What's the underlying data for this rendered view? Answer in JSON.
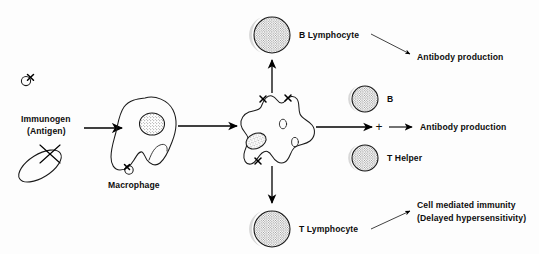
{
  "diagram": {
    "background_color": "#fdfdfd",
    "ink_color": "#1a1a1a",
    "labels": {
      "immunogen_line1": "Immunogen",
      "immunogen_line2": "(Antigen)",
      "macrophage": "Macrophage",
      "b_lymphocyte": "B Lymphocyte",
      "t_lymphocyte": "T Lymphocyte",
      "b_cell_short": "B",
      "t_helper": "T Helper",
      "antibody_production_top": "Antibody production",
      "antibody_production_mid": "Antibody production",
      "cell_mediated_line1": "Cell mediated immunity",
      "cell_mediated_line2": "(Delayed hypersensitivity)",
      "plus": "+"
    },
    "nodes": [
      {
        "id": "antigen-particle-small",
        "type": "antigen",
        "label": "",
        "x": 28,
        "y": 80
      },
      {
        "id": "antigen-particle-ellipse",
        "type": "antigen",
        "label": "",
        "x": 40,
        "y": 165
      },
      {
        "id": "macrophage",
        "type": "cell",
        "label": "Macrophage",
        "x": 148,
        "y": 130
      },
      {
        "id": "activated-macrophage",
        "type": "cell",
        "label": "",
        "x": 278,
        "y": 128
      },
      {
        "id": "b-lymphocyte",
        "type": "lymphocyte",
        "label": "B Lymphocyte",
        "x": 272,
        "y": 35
      },
      {
        "id": "t-lymphocyte",
        "type": "lymphocyte",
        "label": "T Lymphocyte",
        "x": 272,
        "y": 229
      },
      {
        "id": "b-cell",
        "type": "lymphocyte",
        "label": "B",
        "x": 365,
        "y": 99
      },
      {
        "id": "t-helper-cell",
        "type": "lymphocyte",
        "label": "T Helper",
        "x": 365,
        "y": 158
      }
    ],
    "arrows": [
      {
        "id": "antigen-to-macrophage",
        "from": "immunogen-label",
        "to": "macrophage",
        "style": "thick"
      },
      {
        "id": "macrophage-to-activated",
        "from": "macrophage",
        "to": "activated-macrophage",
        "style": "thick"
      },
      {
        "id": "activated-to-b-lymphocyte",
        "from": "activated-macrophage",
        "to": "b-lymphocyte",
        "style": "thick-up"
      },
      {
        "id": "activated-to-t-lymphocyte",
        "from": "activated-macrophage",
        "to": "t-lymphocyte",
        "style": "thick-down"
      },
      {
        "id": "activated-to-bt-pair",
        "from": "activated-macrophage",
        "to": "b-cell",
        "style": "thick"
      },
      {
        "id": "pair-to-antibody",
        "from": "plus",
        "to": "antibody_production_mid",
        "style": "thick"
      },
      {
        "id": "b-lymphocyte-to-antibody",
        "from": "b-lymphocyte",
        "to": "antibody_production_top",
        "style": "thin-diagonal"
      },
      {
        "id": "t-lymphocyte-to-cmi",
        "from": "t-lymphocyte",
        "to": "cell_mediated_immunity",
        "style": "thin-diagonal"
      }
    ]
  }
}
